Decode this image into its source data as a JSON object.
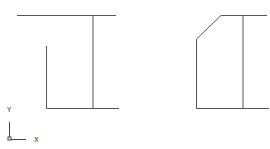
{
  "drawing": {
    "background": "#ffffff",
    "line_color": "#555555",
    "left_view": {
      "description": "Profile view, L-shaped with vertical divider"
    },
    "right_view": {
      "description": "Profile view with chamfered top-left corner and vertical divider"
    }
  },
  "ucs_icon": {
    "x_label": "X",
    "y_label": "Y"
  }
}
